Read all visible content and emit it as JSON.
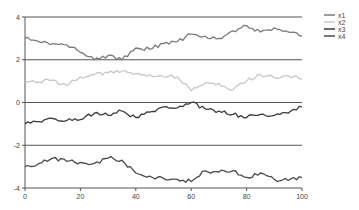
{
  "chart_data": {
    "type": "line",
    "title": "",
    "xlabel": "",
    "ylabel": "",
    "xlim": [
      0,
      100
    ],
    "ylim": [
      -4,
      4
    ],
    "x_ticks": [
      0,
      20,
      40,
      60,
      80,
      100
    ],
    "y_ticks": [
      4,
      2,
      0,
      -2,
      -4
    ],
    "grid": "horizontal",
    "legend_position": "right-top",
    "x": [
      0,
      5,
      10,
      15,
      20,
      25,
      30,
      35,
      40,
      45,
      50,
      55,
      60,
      65,
      70,
      75,
      80,
      85,
      90,
      95,
      100
    ],
    "series": [
      {
        "name": "x1",
        "color": "#7a7a7a",
        "values": [
          3.0,
          2.85,
          2.75,
          2.7,
          2.35,
          2.0,
          2.2,
          2.0,
          2.55,
          2.5,
          2.75,
          2.85,
          3.2,
          3.1,
          3.0,
          3.35,
          3.6,
          3.3,
          3.5,
          3.3,
          3.1
        ]
      },
      {
        "name": "x2",
        "color": "#c8c8c8",
        "values": [
          1.0,
          0.95,
          1.05,
          0.8,
          1.2,
          1.3,
          1.4,
          1.45,
          1.35,
          1.3,
          1.2,
          1.2,
          0.55,
          0.9,
          0.9,
          0.6,
          1.0,
          1.3,
          1.15,
          1.25,
          1.1
        ]
      },
      {
        "name": "x3",
        "color": "#3c3c3c",
        "values": [
          -1.0,
          -0.9,
          -0.75,
          -0.85,
          -0.8,
          -0.5,
          -0.6,
          -0.4,
          -0.7,
          -0.45,
          -0.2,
          -0.25,
          0.0,
          -0.3,
          -0.4,
          -0.55,
          -0.7,
          -0.55,
          -0.6,
          -0.5,
          -0.2
        ]
      },
      {
        "name": "x4",
        "color": "#4a4a4a",
        "values": [
          -3.0,
          -2.85,
          -2.6,
          -2.75,
          -2.8,
          -2.85,
          -2.6,
          -2.7,
          -3.3,
          -3.45,
          -3.55,
          -3.6,
          -3.7,
          -3.2,
          -3.25,
          -3.2,
          -3.5,
          -3.3,
          -3.6,
          -3.65,
          -3.5
        ]
      }
    ]
  },
  "axes": {
    "x_tick_labels": [
      "0",
      "20",
      "40",
      "60",
      "80",
      "100"
    ],
    "y_tick_labels": [
      "4",
      "2",
      "0",
      "-2",
      "-4"
    ]
  },
  "legend": {
    "items": [
      {
        "label": "x1",
        "color": "#7a7a7a"
      },
      {
        "label": "x2",
        "color": "#c8c8c8"
      },
      {
        "label": "x3",
        "color": "#3c3c3c"
      },
      {
        "label": "x4",
        "color": "#4a4a4a"
      }
    ]
  },
  "style": {
    "grid_color": "#555555",
    "axis_color": "#555555"
  }
}
